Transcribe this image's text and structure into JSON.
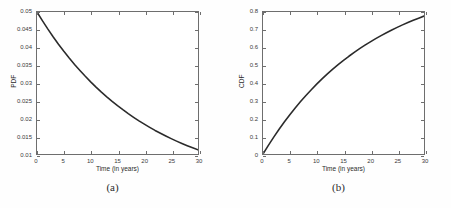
{
  "figure": {
    "background_color": "#fefefe",
    "axis_color": "#6e6e6e",
    "curve_color": "#2b2b2b"
  },
  "panels": [
    {
      "id": "panel-a",
      "caption": "(a)",
      "ylabel": "PDF",
      "xlabel": "Time (in years)",
      "xticks": [
        "0",
        "5",
        "10",
        "15",
        "20",
        "25",
        "30"
      ],
      "yticks": [
        "0.01",
        "0.015",
        "0.02",
        "0.025",
        "0.03",
        "0.035",
        "0.04",
        "0.045",
        "0.05"
      ]
    },
    {
      "id": "panel-b",
      "caption": "(b)",
      "ylabel": "CDF",
      "xlabel": "Time (in years)",
      "xticks": [
        "0",
        "5",
        "10",
        "15",
        "20",
        "25",
        "30"
      ],
      "yticks": [
        "0",
        "0.1",
        "0.2",
        "0.3",
        "0.4",
        "0.5",
        "0.6",
        "0.7",
        "0.8"
      ]
    }
  ],
  "chart_data": [
    {
      "type": "line",
      "title": "(a)",
      "xlabel": "Time (in years)",
      "ylabel": "PDF",
      "xlim": [
        0,
        30
      ],
      "ylim": [
        0.01,
        0.05
      ],
      "xticks": [
        0,
        5,
        10,
        15,
        20,
        25,
        30
      ],
      "yticks": [
        0.01,
        0.015,
        0.02,
        0.025,
        0.03,
        0.035,
        0.04,
        0.045,
        0.05
      ],
      "grid": false,
      "legend": null,
      "series": [
        {
          "name": "Exponential PDF (lambda = 0.05)",
          "x": [
            0,
            1,
            2,
            3,
            4,
            5,
            6,
            7,
            8,
            9,
            10,
            11,
            12,
            13,
            14,
            15,
            16,
            17,
            18,
            19,
            20,
            21,
            22,
            23,
            24,
            25,
            26,
            27,
            28,
            29,
            30
          ],
          "values": [
            0.05,
            0.04756,
            0.04524,
            0.04303,
            0.04094,
            0.03894,
            0.03704,
            0.03523,
            0.03352,
            0.03188,
            0.03033,
            0.02885,
            0.02744,
            0.0261,
            0.02483,
            0.02362,
            0.02247,
            0.02137,
            0.02033,
            0.01934,
            0.0184,
            0.0175,
            0.01664,
            0.01583,
            0.01506,
            0.01433,
            0.01363,
            0.01296,
            0.01233,
            0.01173,
            0.01116
          ]
        }
      ]
    },
    {
      "type": "line",
      "title": "(b)",
      "xlabel": "Time (in years)",
      "ylabel": "CDF",
      "xlim": [
        0,
        30
      ],
      "ylim": [
        0,
        0.8
      ],
      "xticks": [
        0,
        5,
        10,
        15,
        20,
        25,
        30
      ],
      "yticks": [
        0,
        0.1,
        0.2,
        0.3,
        0.4,
        0.5,
        0.6,
        0.7,
        0.8
      ],
      "grid": false,
      "legend": null,
      "series": [
        {
          "name": "Exponential CDF (lambda = 0.05)",
          "x": [
            0,
            1,
            2,
            3,
            4,
            5,
            6,
            7,
            8,
            9,
            10,
            11,
            12,
            13,
            14,
            15,
            16,
            17,
            18,
            19,
            20,
            21,
            22,
            23,
            24,
            25,
            26,
            27,
            28,
            29,
            30
          ],
          "values": [
            0,
            0.04877,
            0.09516,
            0.13929,
            0.18127,
            0.2212,
            0.25918,
            0.29531,
            0.32968,
            0.36237,
            0.39347,
            0.42305,
            0.45119,
            0.47795,
            0.50341,
            0.52763,
            0.55067,
            0.57259,
            0.59343,
            0.61325,
            0.63212,
            0.65006,
            0.66713,
            0.68336,
            0.69881,
            0.7135,
            0.72747,
            0.74075,
            0.7534,
            0.76541,
            0.77687
          ]
        }
      ]
    }
  ]
}
